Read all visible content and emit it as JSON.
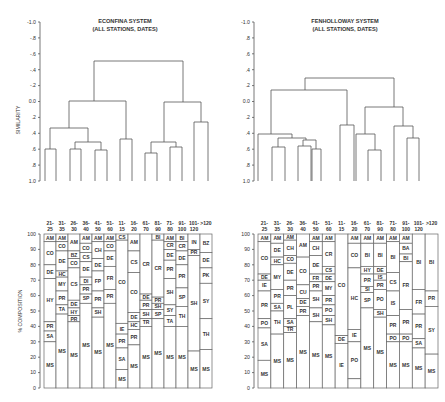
{
  "chart_data": [
    {
      "type": "dendrogram",
      "title": "ECONFINA SYSTEM",
      "subtitle": "(ALL STATIONS, DATES)",
      "ylabel": "SIMILARITY",
      "yticks": [
        "-1.0",
        "-.8",
        "-.6",
        "-.4",
        "-.2",
        "0.0",
        ".2",
        ".4",
        ".6",
        ".8",
        "1.0"
      ],
      "ylim": [
        -1.0,
        1.0
      ],
      "leaves": 11,
      "merges": [
        {
          "left": 0,
          "right": 1,
          "height": 0.6
        },
        {
          "left": 2,
          "right": 3,
          "height": 0.6
        },
        {
          "left": 4,
          "right": 5,
          "height": 0.62
        },
        {
          "left": "g23",
          "right": "g45",
          "height": 0.52
        },
        {
          "left": "g01",
          "right": "g2345",
          "height": 0.35
        },
        {
          "left": 6,
          "right": 7,
          "height": 0.48
        },
        {
          "left": "g0-5",
          "right": "g67",
          "height": 0.0
        },
        {
          "left": 8,
          "right": 9,
          "height": 0.65
        },
        {
          "left": 10,
          "right": 11,
          "height": 0.58
        },
        {
          "left": "g89",
          "right": "g1011",
          "height": 0.5
        },
        {
          "left": 12,
          "right": 13,
          "height": 0.26
        },
        {
          "left": "g8-11",
          "right": "g1213",
          "height": 0.0
        },
        {
          "left": "left",
          "right": "right",
          "height": -0.5
        }
      ]
    },
    {
      "type": "dendrogram",
      "title": "FENHOLLOWAY SYSTEM",
      "subtitle": "(ALL STATIONS, DATES)",
      "yticks": [
        "-1.0",
        ".8",
        ".6",
        ".4",
        ".2",
        "0.0",
        ".2",
        ".4",
        ".6",
        ".8",
        "1.0"
      ],
      "ylim": [
        -1.0,
        1.0
      ]
    },
    {
      "type": "stacked_bar",
      "title": "Econfina size-class composition",
      "ylabel": "% COMPOSITION",
      "ylim": [
        0,
        100
      ],
      "yticks": [
        0,
        10,
        20,
        30,
        40,
        50,
        60,
        70,
        80,
        90,
        100
      ],
      "categories": [
        "21-25",
        "31-35",
        "26-30",
        "36-40",
        "41-50",
        "51-60",
        "11-15",
        "16-20",
        "61-70",
        "81-90",
        "71-80",
        "91-100",
        "101-120",
        ">120"
      ]
    },
    {
      "type": "stacked_bar",
      "title": "Fenholloway size-class composition",
      "ylabel": "% COMPOSITION",
      "ylim": [
        0,
        100
      ],
      "yticks": [
        0,
        10,
        20,
        30,
        40,
        50,
        60,
        70,
        80,
        90,
        100
      ],
      "categories": [
        "21-25",
        "31-35",
        "26-30",
        "36-40",
        "41-50",
        "51-60",
        "11-15",
        "16-20",
        "61-70",
        "81-90",
        "71-80",
        "91-100",
        "101-120",
        ">120"
      ]
    }
  ],
  "left": {
    "title": "ECONFINA SYSTEM",
    "subtitle": "(ALL STATIONS, DATES)",
    "dendro_ylabel": "SIMILARITY",
    "dendro_ticks": [
      "-1.0",
      "-.8",
      "-.6",
      "-.4",
      "-.2",
      "0.0",
      ".2",
      ".4",
      ".6",
      ".8",
      "1.0"
    ],
    "bar_ylabel": "% COMPOSITION",
    "bar_ticks": [
      "100",
      "90",
      "80",
      "70",
      "60",
      "50",
      "40",
      "30",
      "20",
      "10",
      "0"
    ],
    "headers": [
      [
        "21-",
        "25"
      ],
      [
        "31-",
        "35"
      ],
      [
        "26-",
        "30"
      ],
      [
        "36-",
        "40"
      ],
      [
        "41-",
        "50"
      ],
      [
        "51-",
        "60"
      ],
      [
        "11-",
        "15"
      ],
      [
        "16-",
        "20"
      ],
      [
        "61-",
        "70"
      ],
      [
        "81-",
        "90"
      ],
      [
        "71-",
        "80"
      ],
      [
        "91-",
        "100"
      ],
      [
        "101-",
        "120"
      ],
      [
        ">120",
        ""
      ]
    ],
    "columns": [
      [
        [
          "AM",
          100,
          95
        ],
        [
          "CO",
          95,
          80
        ],
        [
          "DE",
          80,
          71
        ],
        [
          "HY",
          71,
          43
        ],
        [
          "PR",
          43,
          37
        ],
        [
          "SA",
          37,
          30
        ],
        [
          "MS",
          30,
          0
        ]
      ],
      [
        [
          "AM",
          100,
          95
        ],
        [
          "CO",
          95,
          89
        ],
        [
          "DE",
          89,
          76
        ],
        [
          "HC",
          76,
          72
        ],
        [
          "MY",
          72,
          63
        ],
        [
          "PR",
          63,
          54
        ],
        [
          "TA",
          54,
          48
        ],
        [
          "MS",
          48,
          0
        ]
      ],
      [
        [
          "AM",
          100,
          89
        ],
        [
          "BZ",
          89,
          84
        ],
        [
          "CO",
          84,
          78
        ],
        [
          "CS",
          78,
          57
        ],
        [
          "DE",
          57,
          52
        ],
        [
          "HY",
          52,
          47
        ],
        [
          "PR",
          47,
          43
        ],
        [
          "MS",
          43,
          0
        ]
      ],
      [
        [
          "AM",
          100,
          94
        ],
        [
          "CO",
          94,
          88
        ],
        [
          "CS",
          88,
          82
        ],
        [
          "DE",
          82,
          72
        ],
        [
          "DI",
          72,
          67
        ],
        [
          "PR",
          67,
          61
        ],
        [
          "SP",
          61,
          55
        ],
        [
          "MS",
          55,
          0
        ]
      ],
      [
        [
          "AM",
          100,
          95
        ],
        [
          "CH",
          95,
          84
        ],
        [
          "DE",
          84,
          76
        ],
        [
          "FP",
          76,
          63
        ],
        [
          "PR",
          63,
          52
        ],
        [
          "SH",
          52,
          46
        ],
        [
          "MS",
          46,
          0
        ]
      ],
      [
        [
          "AM",
          100,
          95
        ],
        [
          "CO",
          95,
          89
        ],
        [
          "DE",
          89,
          79
        ],
        [
          "FR",
          79,
          64
        ],
        [
          "PR",
          64,
          55
        ],
        [
          "MS",
          55,
          0
        ]
      ],
      [
        [
          "CS",
          100,
          96
        ],
        [
          "CO",
          96,
          42
        ],
        [
          "IE",
          42,
          35
        ],
        [
          "PR",
          35,
          26
        ],
        [
          "SA",
          26,
          12
        ],
        [
          "MS",
          12,
          0
        ]
      ],
      [
        [
          "AM",
          100,
          89
        ],
        [
          "CS",
          89,
          75
        ],
        [
          "CO",
          75,
          49
        ],
        [
          "DE",
          49,
          43
        ],
        [
          "HC",
          43,
          38
        ],
        [
          "PR",
          38,
          28
        ],
        [
          "MS",
          28,
          0
        ]
      ],
      [
        [
          "CR",
          100,
          61
        ],
        [
          "DE",
          61,
          57
        ],
        [
          "PR",
          57,
          51
        ],
        [
          "SH",
          51,
          45
        ],
        [
          "TR",
          45,
          40
        ],
        [
          "MS",
          40,
          0
        ]
      ],
      [
        [
          "BI",
          100,
          96
        ],
        [
          "CR",
          96,
          59
        ],
        [
          "PR",
          59,
          55
        ],
        [
          "SH",
          55,
          51
        ],
        [
          "SP",
          51,
          45
        ],
        [
          "MS",
          45,
          0
        ]
      ],
      [
        [
          "AM",
          100,
          95
        ],
        [
          "CR",
          95,
          90
        ],
        [
          "DE",
          90,
          83
        ],
        [
          "PR",
          83,
          71
        ],
        [
          "SH",
          71,
          54
        ],
        [
          "SY",
          54,
          47
        ],
        [
          "TA",
          47,
          40
        ],
        [
          "MS",
          40,
          0
        ]
      ],
      [
        [
          "BI",
          100,
          95
        ],
        [
          "CR",
          95,
          89
        ],
        [
          "DE",
          89,
          80
        ],
        [
          "PR",
          80,
          65
        ],
        [
          "SP",
          65,
          53
        ],
        [
          "TH",
          53,
          40
        ],
        [
          "MS",
          40,
          0
        ]
      ],
      [
        [
          "IN",
          100,
          90
        ],
        [
          "PR",
          90,
          86
        ],
        [
          "SH",
          86,
          24
        ],
        [
          "MS",
          24,
          0
        ]
      ],
      [
        [
          "BZ",
          100,
          88
        ],
        [
          "DE",
          88,
          78
        ],
        [
          "PK",
          78,
          68
        ],
        [
          "SY",
          68,
          45
        ],
        [
          "TH",
          45,
          25
        ],
        [
          "MS",
          25,
          0
        ]
      ]
    ]
  },
  "right": {
    "title": "FENHOLLOWAY SYSTEM",
    "subtitle": "(ALL STATIONS, DATES)",
    "dendro_ticks": [
      "-1.0",
      ".8",
      ".6",
      ".4",
      ".2",
      "0.0",
      ".2",
      ".4",
      ".6",
      ".8",
      "1.0"
    ],
    "bar_ticks": [
      "100",
      "90",
      "80",
      "70",
      "60",
      "50",
      "40",
      "30",
      "20",
      "10",
      "0"
    ],
    "headers": [
      [
        "21-",
        "25"
      ],
      [
        "31-",
        "35"
      ],
      [
        "26-",
        "30"
      ],
      [
        "36-",
        "40"
      ],
      [
        "41-",
        "50"
      ],
      [
        "51-",
        "60"
      ],
      [
        "11-",
        "15"
      ],
      [
        "16-",
        "20"
      ],
      [
        "61-",
        "70"
      ],
      [
        "81-",
        "90"
      ],
      [
        "71-",
        "80"
      ],
      [
        "91-",
        "100"
      ],
      [
        "101-",
        "120"
      ],
      [
        ">120",
        ""
      ]
    ],
    "columns": [
      [
        [
          "AM",
          100,
          95
        ],
        [
          "CO",
          95,
          74
        ],
        [
          "DE",
          74,
          70
        ],
        [
          "IE",
          70,
          63
        ],
        [
          "PR",
          63,
          45
        ],
        [
          "PO",
          45,
          39
        ],
        [
          "SA",
          39,
          18
        ],
        [
          "MS",
          18,
          0
        ]
      ],
      [
        [
          "AM",
          100,
          94
        ],
        [
          "DE",
          94,
          85
        ],
        [
          "HC",
          85,
          80
        ],
        [
          "MY",
          80,
          64
        ],
        [
          "PR",
          64,
          55
        ],
        [
          "SA",
          55,
          50
        ],
        [
          "TH",
          50,
          35
        ],
        [
          "MS",
          35,
          0
        ]
      ],
      [
        [
          "AM",
          100,
          96
        ],
        [
          "CH",
          96,
          86
        ],
        [
          "CO",
          86,
          81
        ],
        [
          "DE",
          81,
          70
        ],
        [
          "PR",
          70,
          60
        ],
        [
          "PL",
          60,
          45
        ],
        [
          "SA",
          45,
          40
        ],
        [
          "TR",
          40,
          36
        ],
        [
          "MS",
          36,
          0
        ]
      ],
      [
        [
          "AM",
          100,
          85
        ],
        [
          "CO",
          85,
          67
        ],
        [
          "CU",
          67,
          58
        ],
        [
          "DE",
          58,
          53
        ],
        [
          "PR",
          53,
          47
        ],
        [
          "MS",
          47,
          0
        ]
      ],
      [
        [
          "AM",
          100,
          95
        ],
        [
          "CH",
          95,
          86
        ],
        [
          "DE",
          86,
          74
        ],
        [
          "FR",
          74,
          69
        ],
        [
          "PR",
          69,
          63
        ],
        [
          "SH",
          63,
          52
        ],
        [
          "SH",
          52,
          43
        ],
        [
          "MS",
          43,
          0
        ]
      ],
      [
        [
          "AM",
          100,
          95
        ],
        [
          "CR",
          95,
          79
        ],
        [
          "CS",
          79,
          74
        ],
        [
          "DE",
          74,
          69
        ],
        [
          "MY",
          69,
          60
        ],
        [
          "PR",
          60,
          54
        ],
        [
          "PO",
          54,
          47
        ],
        [
          "SH",
          47,
          41
        ],
        [
          "MS",
          41,
          0
        ]
      ],
      [
        [
          "CO",
          100,
          34
        ],
        [
          "DE",
          34,
          29
        ],
        [
          "IE",
          29,
          0
        ]
      ],
      [
        [
          "AM",
          100,
          94
        ],
        [
          "CO",
          94,
          78
        ],
        [
          "HC",
          78,
          38
        ],
        [
          "IE",
          38,
          30
        ],
        [
          "PO",
          30,
          6
        ],
        [
          "",
          6,
          0
        ]
      ],
      [
        [
          "AM",
          100,
          94
        ],
        [
          "BI",
          94,
          79
        ],
        [
          "HY",
          79,
          74
        ],
        [
          "PR",
          74,
          66
        ],
        [
          "SI",
          66,
          62
        ],
        [
          "SP",
          62,
          52
        ],
        [
          "MS",
          52,
          0
        ]
      ],
      [
        [
          "AM",
          100,
          94
        ],
        [
          "BI",
          94,
          79
        ],
        [
          "DE",
          79,
          74
        ],
        [
          "IS",
          74,
          70
        ],
        [
          "PR",
          70,
          64
        ],
        [
          "PO",
          64,
          51
        ],
        [
          "SH",
          51,
          46
        ],
        [
          "MS",
          46,
          0
        ]
      ],
      [
        [
          "AM",
          100,
          95
        ],
        [
          "BI",
          95,
          75
        ],
        [
          "CS",
          75,
          63
        ],
        [
          "IS",
          63,
          47
        ],
        [
          "PR",
          47,
          35
        ],
        [
          "PO",
          35,
          30
        ],
        [
          "MS",
          30,
          0
        ]
      ],
      [
        [
          "AM",
          100,
          94
        ],
        [
          "BA",
          94,
          87
        ],
        [
          "BI",
          87,
          82
        ],
        [
          "FR",
          82,
          51
        ],
        [
          "PR",
          51,
          35
        ],
        [
          "PO",
          35,
          30
        ],
        [
          "MS",
          30,
          0
        ]
      ],
      [
        [
          "BI",
          100,
          64
        ],
        [
          "FR",
          64,
          48
        ],
        [
          "PR",
          48,
          32
        ],
        [
          "SA",
          32,
          26
        ],
        [
          "MS",
          26,
          0
        ]
      ],
      [
        [
          "BI",
          100,
          63
        ],
        [
          "PR",
          63,
          53
        ],
        [
          "SY",
          53,
          22
        ],
        [
          "MS",
          22,
          0
        ]
      ]
    ]
  }
}
